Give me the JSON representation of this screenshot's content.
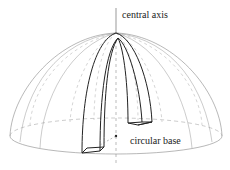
{
  "diagram": {
    "labels": {
      "central_axis": "central axis",
      "circular_base": "circular base"
    },
    "colors": {
      "line": "#333333",
      "light_line": "#999999",
      "background": "#ffffff"
    }
  }
}
